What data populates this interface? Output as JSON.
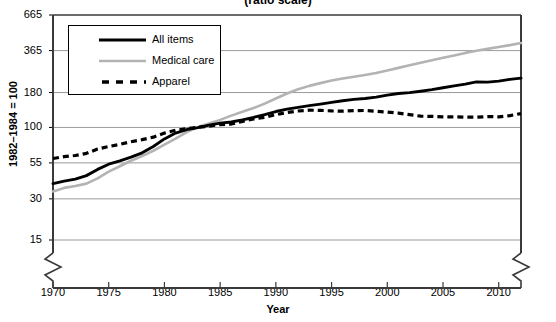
{
  "chart_data": {
    "type": "line",
    "title": "(ratio scale)",
    "xlabel": "Year",
    "ylabel": "1982–1984 = 100",
    "scale": "log",
    "grid": true,
    "legend_position": "top-left",
    "ylim": [
      15,
      665
    ],
    "xlim": [
      1970,
      2012
    ],
    "ytick_labels": [
      "665",
      "365",
      "180",
      "100",
      "55",
      "30",
      "15"
    ],
    "ytick_values": [
      665,
      365,
      180,
      100,
      55,
      30,
      15
    ],
    "xtick_labels": [
      "1970",
      "1975",
      "1980",
      "1985",
      "1990",
      "1995",
      "2000",
      "2005",
      "2010"
    ],
    "xtick_values": [
      1970,
      1975,
      1980,
      1985,
      1990,
      1995,
      2000,
      2005,
      2010
    ],
    "axis_break": "y-axis broken below 15",
    "x": [
      1970,
      1971,
      1972,
      1973,
      1974,
      1975,
      1976,
      1977,
      1978,
      1979,
      1980,
      1981,
      1982,
      1983,
      1984,
      1985,
      1986,
      1987,
      1988,
      1989,
      1990,
      1991,
      1992,
      1993,
      1994,
      1995,
      1996,
      1997,
      1998,
      1999,
      2000,
      2001,
      2002,
      2003,
      2004,
      2005,
      2006,
      2007,
      2008,
      2009,
      2010,
      2011,
      2012
    ],
    "series": [
      {
        "name": "All items",
        "color": "#000000",
        "style": "solid-thick",
        "values": [
          38.8,
          40.5,
          41.8,
          44.4,
          49.3,
          53.8,
          56.9,
          60.6,
          65.2,
          72.6,
          82.4,
          90.9,
          96.5,
          99.6,
          103.9,
          107.6,
          109.6,
          113.6,
          118.3,
          124.0,
          130.7,
          136.2,
          140.3,
          144.5,
          148.2,
          152.4,
          156.9,
          160.5,
          163.0,
          166.6,
          172.2,
          177.1,
          179.9,
          184.0,
          188.9,
          195.3,
          201.6,
          207.3,
          215.3,
          214.5,
          218.1,
          224.9,
          229.6
        ]
      },
      {
        "name": "Medical care",
        "color": "#b3b3b3",
        "style": "solid-thin",
        "values": [
          34.0,
          36.1,
          37.3,
          38.8,
          42.4,
          47.5,
          52.0,
          57.0,
          61.8,
          67.5,
          74.9,
          82.9,
          92.5,
          100.6,
          106.8,
          113.5,
          122.0,
          130.1,
          138.6,
          149.3,
          162.8,
          177.0,
          190.1,
          201.4,
          211.0,
          220.5,
          228.2,
          234.6,
          242.1,
          250.6,
          260.8,
          272.8,
          285.6,
          297.1,
          310.1,
          323.2,
          336.2,
          351.1,
          364.1,
          375.6,
          388.4,
          400.3,
          414.9
        ]
      },
      {
        "name": "Apparel",
        "color": "#000000",
        "style": "dashed",
        "values": [
          59.2,
          61.1,
          62.3,
          64.6,
          69.4,
          72.5,
          75.2,
          78.6,
          81.4,
          84.9,
          90.9,
          95.3,
          97.8,
          100.2,
          102.1,
          105.0,
          105.9,
          110.6,
          115.4,
          118.6,
          124.1,
          128.7,
          131.9,
          133.7,
          133.4,
          132.0,
          131.7,
          132.9,
          133.0,
          131.3,
          129.6,
          127.3,
          124.0,
          120.9,
          120.4,
          119.5,
          119.5,
          118.9,
          118.9,
          120.1,
          119.5,
          122.1,
          126.3
        ]
      }
    ]
  },
  "legend": {
    "entries": [
      {
        "label": "All items",
        "swatch": "thick-black-line"
      },
      {
        "label": "Medical care",
        "swatch": "gray-line"
      },
      {
        "label": "Apparel",
        "swatch": "black-dashed-line"
      }
    ]
  }
}
